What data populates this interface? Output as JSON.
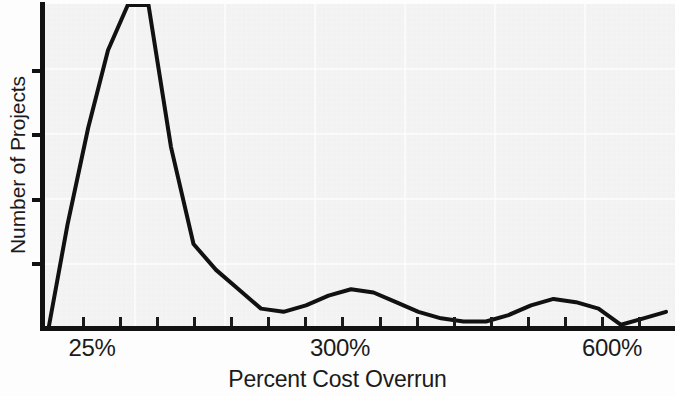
{
  "chart_data": {
    "type": "line",
    "title": "",
    "subtitle": "",
    "xlabel": "Percent Cost Overrun",
    "ylabel": "Number of Projects",
    "grid": true,
    "grid_color": "#ffffff",
    "legend": "none",
    "line_color": "#111111",
    "background_color": "#f2f2f2",
    "xlim": [
      0,
      700
    ],
    "ylim": [
      0,
      100
    ],
    "x_tick_labels": [
      {
        "value": 25,
        "label": "25%",
        "px": 92
      },
      {
        "value": 300,
        "label": "300%",
        "px": 340
      },
      {
        "value": 600,
        "label": "600%",
        "px": 612
      }
    ],
    "y_tick_labels": [],
    "y_tick_count": 4,
    "x_minor_tick_count": 16,
    "series": [
      {
        "name": "Number of Projects",
        "x": [
          4,
          25,
          48,
          70,
          92,
          115,
          140,
          165,
          190,
          215,
          240,
          265,
          290,
          315,
          340,
          365,
          390,
          415,
          440,
          465,
          490,
          515,
          540,
          565,
          590,
          615,
          640,
          665,
          690
        ],
        "values": [
          0,
          32,
          62,
          86,
          100,
          100,
          56,
          26,
          18,
          12,
          6,
          5,
          7,
          10,
          12,
          11,
          8,
          5,
          3,
          2,
          2,
          4,
          7,
          9,
          8,
          6,
          1,
          3,
          5
        ]
      }
    ],
    "annotations": []
  },
  "axes": {
    "x_title": "Percent Cost Overrun",
    "y_title": "Number of Projects",
    "x_labels": [
      "25%",
      "300%",
      "600%"
    ]
  }
}
